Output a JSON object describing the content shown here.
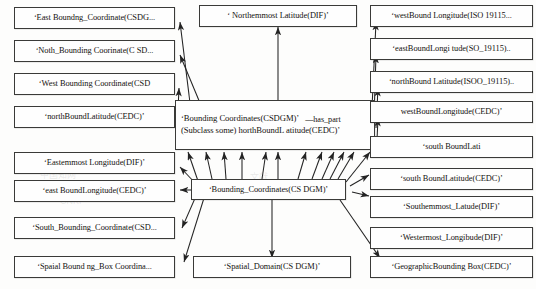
{
  "diagram": {
    "edge_color": "#232323",
    "node_border_color": "#3a3a38",
    "node_fill": "#fefefe",
    "relation_label": "has_part",
    "nodes": {
      "center_top": {
        "line1": "‘Bounding Coordinates(CSDGM)’",
        "relation": "—has_part",
        "line2": "(Subclass some) horthBoundL atitude(CEDC)’"
      },
      "center_hub": "‘Bounding_Coordinates(CS DGM)’",
      "top_center": "‘ Northemmost Latitude(DIF)’",
      "bottom_center": "‘Spatial_Domain(CS DGM)’"
    },
    "left_column": [
      {
        "label": "‘East Boundng_Coordinate(CSDG..."
      },
      {
        "label": "‘Noth_Bounding Coorinate(C SD..."
      },
      {
        "label": "‘West Bounding Coordinate(CSD"
      },
      {
        "label": "‘northBoundLatitude(CEDC)’"
      },
      {
        "label": "‘Eastemmost Longitude(DIF)’"
      },
      {
        "label": "‘east BoundLongitude(CEDC)’"
      },
      {
        "label": "‘South_Bounding_Coordinate(CSD..."
      },
      {
        "label": "‘Spaial Bound ng_Box Coordina..."
      }
    ],
    "right_column": [
      {
        "label": "‘westBound Longitude(ISO 19115..."
      },
      {
        "label": "‘eastBoundLongi tude(SO_19115).."
      },
      {
        "label": "‘northBound Latitude(ISOO_19115).."
      },
      {
        "label": "westBoundLongitude(CEDC)’"
      },
      {
        "label": "‘south BoundLati"
      },
      {
        "label": "‘south BoundLatitude(CEDC)’"
      },
      {
        "label": "‘Southemmost_Latude(DIF)’"
      },
      {
        "label": "‘Westermost_Longibude(DIF)’"
      },
      {
        "label": "‘GeographicBounding Box(CEDC)’"
      }
    ]
  }
}
